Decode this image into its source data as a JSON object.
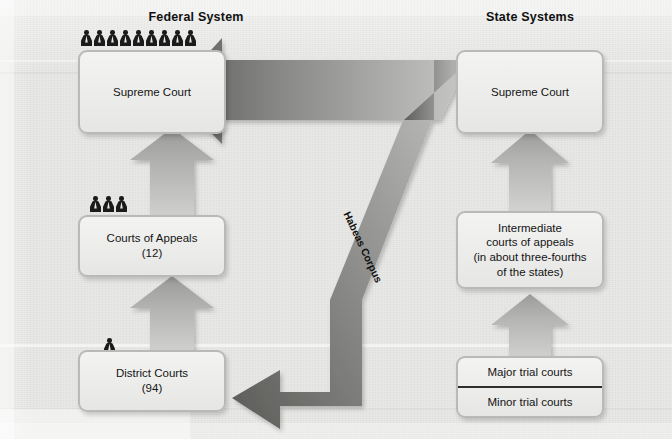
{
  "diagram": {
    "columns": [
      {
        "id": "federal",
        "heading": "Federal System"
      },
      {
        "id": "state",
        "heading": "State Systems"
      }
    ],
    "federal": {
      "supreme_court": {
        "label": "Supreme Court",
        "justices": 9
      },
      "courts_of_appeals": {
        "label": "Courts of Appeals\n(12)",
        "judges": 3
      },
      "district_courts": {
        "label": "District Courts\n(94)",
        "judges": 1
      }
    },
    "state": {
      "supreme_court": {
        "label": "Supreme Court"
      },
      "intermediate": {
        "label": "Intermediate\ncourts of appeals\n(in about three-fourths\nof the states)"
      },
      "trial_courts": {
        "major": "Major trial courts",
        "minor": "Minor trial courts"
      }
    },
    "habeas_label": "Habeas Corpus",
    "colors": {
      "background": "#e8e8e6",
      "box_fill": "#efefed",
      "box_border": "#b9b9b7",
      "arrow_light": "#b8b8b6",
      "arrow_dark": "#5f5f5f",
      "text": "#141414"
    },
    "icons": {
      "justice": "person-icon",
      "appeal_arrow": "up-arrow-icon",
      "habeas_arrow": "bent-arrow-icon"
    }
  }
}
